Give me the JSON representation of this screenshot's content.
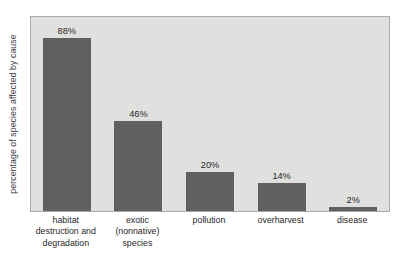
{
  "chart_data": {
    "type": "bar",
    "title": "",
    "subtitle": "",
    "xlabel": "",
    "ylabel": "percentage of species affected by cause",
    "categories": [
      "habitat destruction and degradation",
      "exotic (nonnative) species",
      "pollution",
      "overharvest",
      "disease"
    ],
    "category_lines": [
      [
        "habitat",
        "destruction and",
        "degradation"
      ],
      [
        "exotic",
        "(nonnative)",
        "species"
      ],
      [
        "pollution"
      ],
      [
        "overharvest"
      ],
      [
        "disease"
      ]
    ],
    "values": [
      88,
      46,
      20,
      14,
      2
    ],
    "value_labels": [
      "88%",
      "46%",
      "20%",
      "14%",
      "2%"
    ],
    "ylim": [
      0,
      100
    ],
    "grid": false,
    "legend": "none",
    "axis_ticks_visible": false,
    "colors": {
      "bar": "#615f5f",
      "plot_background": "#e0e0de",
      "plot_border": "#a9a9a7",
      "page_background": "#ffffff",
      "text": "#1f1f1f",
      "axis_title_text": "#3b3b3b"
    }
  }
}
